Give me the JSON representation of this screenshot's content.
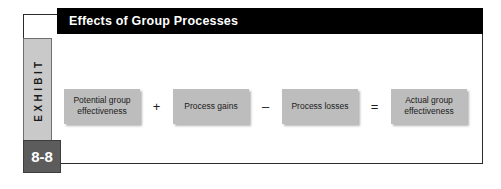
{
  "exhibit": {
    "tab_label": "EXHIBIT",
    "number": "8-8",
    "title": "Effects of Group Processes"
  },
  "flow": {
    "items": [
      {
        "type": "box",
        "label": "Potential group effectiveness",
        "name": "flow-box-potential-group-effectiveness"
      },
      {
        "type": "operator",
        "label": "+",
        "name": "operator-plus"
      },
      {
        "type": "box",
        "label": "Process gains",
        "name": "flow-box-process-gains"
      },
      {
        "type": "operator",
        "label": "–",
        "name": "operator-minus"
      },
      {
        "type": "box",
        "label": "Process losses",
        "name": "flow-box-process-losses"
      },
      {
        "type": "operator",
        "label": "=",
        "name": "operator-equals"
      },
      {
        "type": "box",
        "label": "Actual group effectiveness",
        "name": "flow-box-actual-group-effectiveness"
      }
    ]
  },
  "colors": {
    "title_bar": "#000000",
    "title_text": "#ffffff",
    "tab_fill": "#c9c9c9",
    "number_fill": "#5c5c5c",
    "box_fill": "#bdbdbd",
    "frame_border": "#2b2b2b",
    "page_background": "#ffffff"
  }
}
